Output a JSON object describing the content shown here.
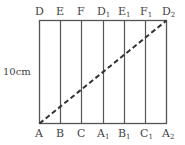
{
  "diagram": {
    "top_labels": [
      {
        "base": "D",
        "sub": ""
      },
      {
        "base": "E",
        "sub": ""
      },
      {
        "base": "F",
        "sub": ""
      },
      {
        "base": "D",
        "sub": "1"
      },
      {
        "base": "E",
        "sub": "1"
      },
      {
        "base": "F",
        "sub": "1"
      },
      {
        "base": "D",
        "sub": "2"
      }
    ],
    "bottom_labels": [
      {
        "base": "A",
        "sub": ""
      },
      {
        "base": "B",
        "sub": ""
      },
      {
        "base": "C",
        "sub": ""
      },
      {
        "base": "A",
        "sub": "1"
      },
      {
        "base": "B",
        "sub": "1"
      },
      {
        "base": "C",
        "sub": "1"
      },
      {
        "base": "A",
        "sub": "2"
      }
    ],
    "height_label": "10cm",
    "colors": {
      "line": "#555555",
      "dashed": "#333333",
      "text": "#444444"
    }
  }
}
